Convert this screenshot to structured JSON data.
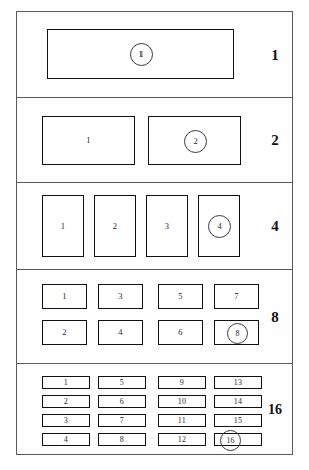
{
  "figure": {
    "outline_color": "#111111",
    "frame_color": "#5a5a5a",
    "background": "#ffffff"
  },
  "bands": [
    {
      "label": "1",
      "name": "partition-level-1",
      "layout": "1 x 1",
      "blocks": [
        {
          "id": "1",
          "circled": true
        }
      ]
    },
    {
      "label": "2",
      "name": "partition-level-2",
      "layout": "2 x 1",
      "blocks": [
        {
          "id": "1",
          "circled": false
        },
        {
          "id": "2",
          "circled": true
        }
      ]
    },
    {
      "label": "4",
      "name": "partition-level-4",
      "layout": "4 x 1",
      "blocks": [
        {
          "id": "1",
          "circled": false
        },
        {
          "id": "2",
          "circled": false
        },
        {
          "id": "3",
          "circled": false
        },
        {
          "id": "4",
          "circled": true
        }
      ]
    },
    {
      "label": "8",
      "name": "partition-level-8",
      "layout": "4 x 2",
      "blocks": [
        {
          "id": "1",
          "circled": false
        },
        {
          "id": "2",
          "circled": false
        },
        {
          "id": "3",
          "circled": false
        },
        {
          "id": "4",
          "circled": false
        },
        {
          "id": "5",
          "circled": false
        },
        {
          "id": "6",
          "circled": false
        },
        {
          "id": "7",
          "circled": false
        },
        {
          "id": "8",
          "circled": true
        }
      ]
    },
    {
      "label": "16",
      "name": "partition-level-16",
      "layout": "4 x 4",
      "blocks": [
        {
          "id": "1",
          "circled": false
        },
        {
          "id": "2",
          "circled": false
        },
        {
          "id": "3",
          "circled": false
        },
        {
          "id": "4",
          "circled": false
        },
        {
          "id": "5",
          "circled": false
        },
        {
          "id": "6",
          "circled": false
        },
        {
          "id": "7",
          "circled": false
        },
        {
          "id": "8",
          "circled": false
        },
        {
          "id": "9",
          "circled": false
        },
        {
          "id": "10",
          "circled": false
        },
        {
          "id": "11",
          "circled": false
        },
        {
          "id": "12",
          "circled": false
        },
        {
          "id": "13",
          "circled": false
        },
        {
          "id": "14",
          "circled": false
        },
        {
          "id": "15",
          "circled": false
        },
        {
          "id": "16",
          "circled": true
        }
      ]
    }
  ]
}
